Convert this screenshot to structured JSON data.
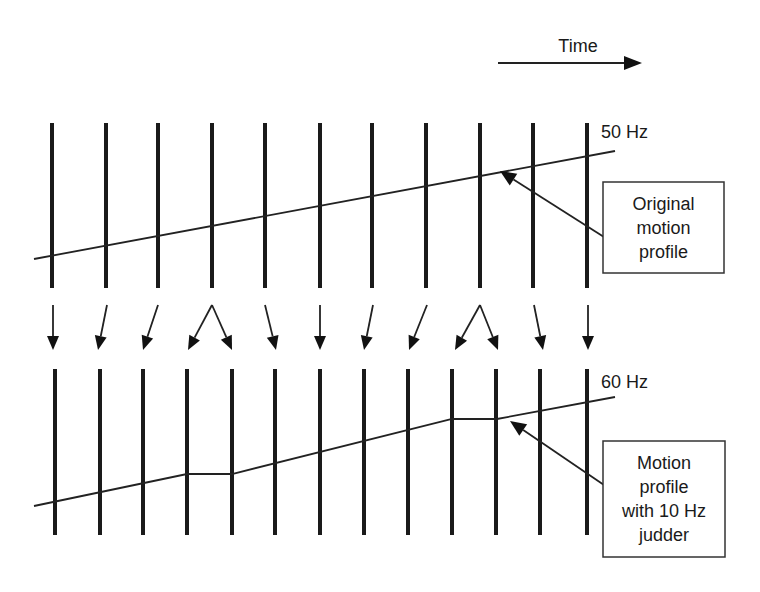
{
  "title": "",
  "time_axis": {
    "label": "Time",
    "arrow": {
      "x1": 498,
      "y1": 63,
      "x2": 640,
      "y2": 63
    }
  },
  "colors": {
    "ink": "#1a1a1a",
    "background": "#ffffff"
  },
  "rows": {
    "top": {
      "rate_label": "50 Hz",
      "bars_x": [
        52,
        106,
        158,
        212,
        265,
        320,
        372,
        426,
        480,
        533,
        587
      ],
      "bar_y": [
        123,
        288
      ],
      "profile": [
        [
          34,
          259
        ],
        [
          615,
          151
        ]
      ],
      "annotation": {
        "lines": [
          "Original",
          "motion",
          "profile"
        ],
        "box": {
          "x": 603,
          "y": 182,
          "w": 121,
          "h": 91
        },
        "pointer": {
          "from": [
            604,
            237
          ],
          "to": [
            500,
            171
          ]
        }
      }
    },
    "bottom": {
      "rate_label": "60 Hz",
      "bars_x": [
        55,
        100,
        143,
        187,
        232,
        275,
        320,
        364,
        408,
        452,
        496,
        540,
        587
      ],
      "bar_y": [
        369,
        535
      ],
      "profile": [
        [
          34,
          506
        ],
        [
          187,
          474
        ],
        [
          232,
          474
        ],
        [
          452,
          419
        ],
        [
          497,
          419
        ],
        [
          615,
          397
        ]
      ],
      "annotation": {
        "lines": [
          "Motion",
          "profile",
          "with 10 Hz",
          "judder"
        ],
        "box": {
          "x": 603,
          "y": 441,
          "w": 122,
          "h": 116
        },
        "pointer": {
          "from": [
            604,
            485
          ],
          "to": [
            510,
            421
          ]
        }
      }
    }
  },
  "frame_mapping_arrows": [
    {
      "from": [
        53,
        305
      ],
      "to": [
        53,
        350
      ]
    },
    {
      "from": [
        107,
        305
      ],
      "to": [
        98,
        350
      ]
    },
    {
      "from": [
        158,
        305
      ],
      "to": [
        143,
        350
      ]
    },
    {
      "from": [
        212,
        305
      ],
      "to": [
        188,
        350
      ]
    },
    {
      "from": [
        212,
        305
      ],
      "to": [
        232,
        350
      ]
    },
    {
      "from": [
        265,
        305
      ],
      "to": [
        276,
        350
      ]
    },
    {
      "from": [
        320,
        305
      ],
      "to": [
        320,
        350
      ]
    },
    {
      "from": [
        373,
        305
      ],
      "to": [
        364,
        350
      ]
    },
    {
      "from": [
        427,
        305
      ],
      "to": [
        409,
        350
      ]
    },
    {
      "from": [
        480,
        305
      ],
      "to": [
        455,
        350
      ]
    },
    {
      "from": [
        480,
        305
      ],
      "to": [
        498,
        350
      ]
    },
    {
      "from": [
        534,
        305
      ],
      "to": [
        543,
        350
      ]
    },
    {
      "from": [
        588,
        305
      ],
      "to": [
        588,
        350
      ]
    }
  ]
}
